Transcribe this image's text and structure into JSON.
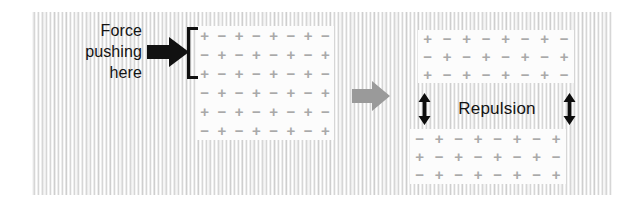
{
  "figure": {
    "background": {
      "paper_color": "#fdfdfd",
      "stripe_color": "#d6d6d6"
    }
  },
  "annotations": {
    "force_caption": {
      "lines": [
        "Force",
        "pushing",
        "here"
      ],
      "color": "#131313"
    },
    "repulsion_label": "Repulsion",
    "force_arrow_icon": "solid-right-arrow-icon",
    "force_arrow_color": "#111111",
    "bracket_icon": "square-bracket-icon",
    "transition_arrow_icon": "grey-right-arrow-icon",
    "transition_arrow_color": "#9a9a9a",
    "repulsion_arrow_icon": "double-headed-vertical-arrow-icon",
    "repulsion_arrow_color": "#0d0d0d"
  },
  "lattices": {
    "symbol_color": "#a9a9a9",
    "plus": "+",
    "minus": "−",
    "left": {
      "label": "intact-ionic-lattice",
      "rows": 6,
      "cols": 8,
      "grid": [
        [
          "+",
          "−",
          "+",
          "−",
          "+",
          "−",
          "+",
          "−"
        ],
        [
          "−",
          "+",
          "−",
          "+",
          "−",
          "+",
          "−",
          "+"
        ],
        [
          "+",
          "−",
          "+",
          "−",
          "+",
          "−",
          "+",
          "−"
        ],
        [
          "−",
          "+",
          "−",
          "+",
          "−",
          "+",
          "−",
          "+"
        ],
        [
          "+",
          "−",
          "+",
          "−",
          "+",
          "−",
          "+",
          "−"
        ],
        [
          "−",
          "+",
          "−",
          "+",
          "−",
          "+",
          "−",
          "+"
        ]
      ]
    },
    "right_top": {
      "label": "shifted-lattice-upper-half",
      "rows": 3,
      "cols": 8,
      "grid": [
        [
          "+",
          "−",
          "+",
          "−",
          "+",
          "−",
          "+",
          "−"
        ],
        [
          "−",
          "+",
          "−",
          "+",
          "−",
          "+",
          "−",
          "+"
        ],
        [
          "+",
          "−",
          "+",
          "−",
          "+",
          "−",
          "+",
          "−"
        ]
      ]
    },
    "right_bottom": {
      "label": "shifted-lattice-lower-half",
      "rows": 3,
      "cols": 8,
      "grid": [
        [
          "−",
          "+",
          "−",
          "+",
          "−",
          "+",
          "−",
          "+"
        ],
        [
          "+",
          "−",
          "+",
          "−",
          "+",
          "−",
          "+",
          "−"
        ],
        [
          "−",
          "+",
          "−",
          "+",
          "−",
          "+",
          "−",
          "+"
        ]
      ]
    }
  }
}
